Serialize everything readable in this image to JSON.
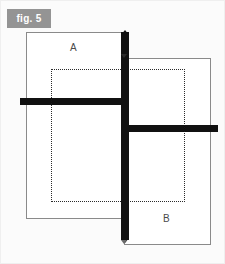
{
  "figure": {
    "tag_label": "fig. 5",
    "tag_bg_color": "#949494",
    "tag_text_color": "#ffffff",
    "frame_border_color": "#efefef",
    "background_color": "#fbfbfb"
  },
  "shapes": {
    "rect_a": {
      "label": "A",
      "border_color": "#8a8a8a",
      "fill_color": "#ffffff",
      "stroke_style": "solid"
    },
    "rect_b": {
      "label": "B",
      "border_color": "#8a8a8a",
      "fill_color": "#ffffff",
      "stroke_style": "solid"
    },
    "dotted_overlay": {
      "border_color": "#2b2b2b",
      "stroke_style": "dotted"
    },
    "vertical_bar": {
      "color": "#111111",
      "arrow_top": "arrow-up-icon",
      "arrow_bottom": "arrow-down-icon"
    },
    "horizontal_bar_left": {
      "color": "#111111"
    },
    "horizontal_bar_right": {
      "color": "#111111"
    }
  }
}
